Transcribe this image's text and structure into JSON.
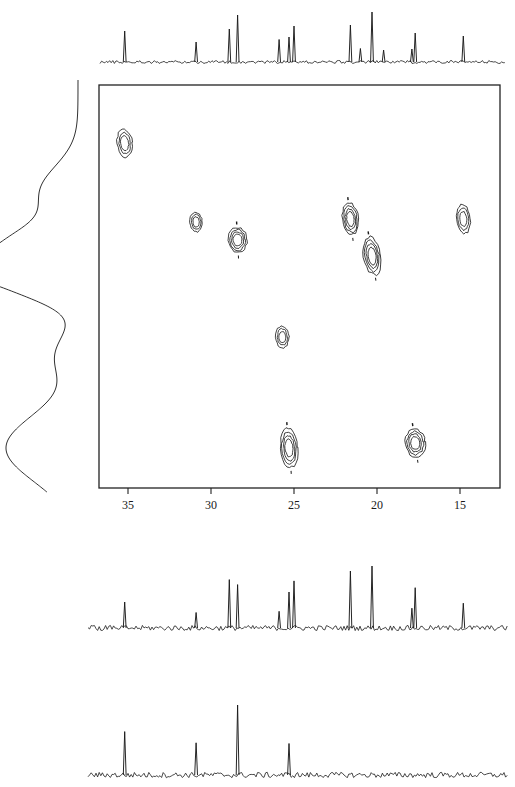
{
  "figure": {
    "kind": "2d-nmr-correlation-spectrum"
  },
  "plot_frame": {
    "x": 99,
    "y": 85,
    "width": 401,
    "height": 403,
    "border_color": "#222222"
  },
  "chart_data": {
    "type": "scatter",
    "title": "",
    "xlabel": "",
    "ylabel": "",
    "grid": false,
    "legend": "none",
    "xlim": [
      37.7,
      13.4
    ],
    "x_axis": {
      "ticks": [
        35,
        30,
        25,
        20,
        15
      ],
      "tick_labels": [
        "35",
        "30",
        "25",
        "20",
        "15"
      ],
      "tick_pixels": [
        128,
        211,
        294,
        377,
        460
      ],
      "direction": "decreasing-left-to-right"
    },
    "ylim": [
      0,
      1
    ],
    "y_axis": {
      "ticks": [],
      "tick_labels": []
    },
    "contour_peaks": [
      {
        "id": "peak-1",
        "x": 35.2,
        "y_px": 143,
        "rx": 7.5,
        "ry": 14.0,
        "levels": 3,
        "tilt": -6
      },
      {
        "id": "peak-2",
        "x": 30.9,
        "y_px": 222,
        "rx": 6.0,
        "ry": 10.0,
        "levels": 3,
        "tilt": -4
      },
      {
        "id": "peak-3",
        "x": 28.4,
        "y_px": 240,
        "rx": 9.5,
        "ry": 12.5,
        "levels": 4,
        "tilt": -3
      },
      {
        "id": "peak-4",
        "x": 21.6,
        "y_px": 219,
        "rx": 8.0,
        "ry": 16.0,
        "levels": 4,
        "tilt": -7
      },
      {
        "id": "peak-5",
        "x": 20.3,
        "y_px": 256,
        "rx": 8.5,
        "ry": 19.0,
        "levels": 4,
        "tilt": -9
      },
      {
        "id": "peak-6",
        "x": 14.8,
        "y_px": 219,
        "rx": 7.0,
        "ry": 14.5,
        "levels": 3,
        "tilt": -6
      },
      {
        "id": "peak-7",
        "x": 25.7,
        "y_px": 337,
        "rx": 6.5,
        "ry": 11.0,
        "levels": 3,
        "tilt": -2
      },
      {
        "id": "peak-8",
        "x": 25.3,
        "y_px": 448,
        "rx": 8.5,
        "ry": 20.0,
        "levels": 4,
        "tilt": -5
      },
      {
        "id": "peak-9",
        "x": 17.7,
        "y_px": 443,
        "rx": 10.0,
        "ry": 14.0,
        "levels": 4,
        "tilt": -8
      }
    ],
    "top_projection": {
      "name": "top-1d-trace",
      "baseline_px": 62,
      "max_height_px": 50,
      "peaks": [
        {
          "x": 35.2,
          "h": 0.62
        },
        {
          "x": 30.9,
          "h": 0.4
        },
        {
          "x": 28.9,
          "h": 0.66
        },
        {
          "x": 28.4,
          "h": 0.94
        },
        {
          "x": 25.9,
          "h": 0.45
        },
        {
          "x": 25.3,
          "h": 0.5
        },
        {
          "x": 25.0,
          "h": 0.72
        },
        {
          "x": 21.6,
          "h": 0.74
        },
        {
          "x": 21.0,
          "h": 0.27
        },
        {
          "x": 20.3,
          "h": 1.0
        },
        {
          "x": 19.6,
          "h": 0.24
        },
        {
          "x": 17.9,
          "h": 0.26
        },
        {
          "x": 17.7,
          "h": 0.58
        },
        {
          "x": 14.8,
          "h": 0.52
        }
      ]
    },
    "left_projection": {
      "name": "left-1d-trace",
      "orientation": "vertical",
      "baseline_px": 78,
      "max_width_px": 72,
      "peaks": [
        {
          "y_px": 192,
          "w": 0.52,
          "width_px": 26
        },
        {
          "y_px": 248,
          "w": 0.95,
          "width_px": 20
        },
        {
          "y_px": 268,
          "w": 0.42,
          "width_px": 10
        },
        {
          "y_px": 283,
          "w": 0.88,
          "width_px": 18
        },
        {
          "y_px": 355,
          "w": 0.3,
          "width_px": 22
        },
        {
          "y_px": 448,
          "w": 1.0,
          "width_px": 34
        }
      ]
    },
    "bottom_trace_1": {
      "name": "lower-1d-spectrum",
      "baseline_px": 628,
      "max_height_px": 62,
      "peaks": [
        {
          "x": 35.2,
          "h": 0.42
        },
        {
          "x": 30.9,
          "h": 0.25
        },
        {
          "x": 28.9,
          "h": 0.78
        },
        {
          "x": 28.4,
          "h": 0.7
        },
        {
          "x": 25.9,
          "h": 0.27
        },
        {
          "x": 25.3,
          "h": 0.58
        },
        {
          "x": 25.0,
          "h": 0.76
        },
        {
          "x": 21.6,
          "h": 0.92
        },
        {
          "x": 20.3,
          "h": 1.0
        },
        {
          "x": 17.9,
          "h": 0.32
        },
        {
          "x": 17.7,
          "h": 0.65
        },
        {
          "x": 14.8,
          "h": 0.4
        }
      ]
    },
    "bottom_trace_2": {
      "name": "bottom-1d-spectrum",
      "baseline_px": 775,
      "max_height_px": 70,
      "peaks": [
        {
          "x": 35.2,
          "h": 0.62
        },
        {
          "x": 30.9,
          "h": 0.46
        },
        {
          "x": 28.4,
          "h": 1.0
        },
        {
          "x": 25.3,
          "h": 0.45
        }
      ]
    }
  },
  "colors": {
    "line": "#1a1a1a",
    "frame": "#222222",
    "background": "#ffffff"
  }
}
